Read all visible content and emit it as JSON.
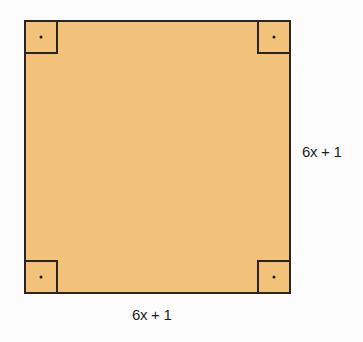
{
  "diagram": {
    "shape": "square",
    "fill_color": "#f2c27a",
    "stroke_color": "#2b2420",
    "right_angle_markers": 4,
    "side_labels": {
      "bottom": "6x + 1",
      "right": "6x + 1"
    }
  }
}
